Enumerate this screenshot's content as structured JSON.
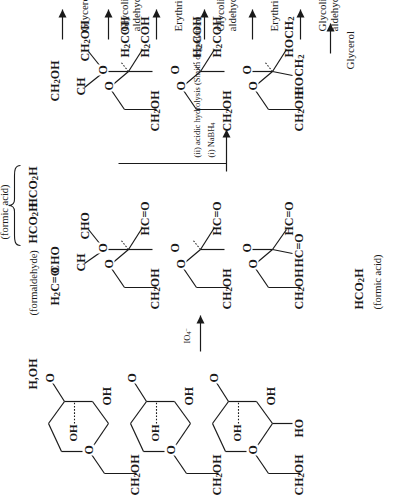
{
  "figure": {
    "orientation": "rotated-90-ccw",
    "background": "#ffffff",
    "ink": "#1a1a1a"
  },
  "reagents": {
    "step1": {
      "label": "IO",
      "sub": "4",
      "sup": "–",
      "full": "IO4–"
    },
    "step2": {
      "line1": "(i) NaBH4",
      "line1_pre": "(i) NaBH",
      "line1_sub": "4",
      "line2": "(ii) acidic hydrolysis (Smith degradation)"
    }
  },
  "column1": {
    "name": "starting polysaccharide",
    "repeat_labels": [
      "CH2OH",
      "CH2OH",
      "CH2OH",
      "CH2OH"
    ],
    "ch2oh_pre": "CH",
    "ch2oh_sub": "2",
    "ch2oh_post": "OH",
    "ring_oxygen": "O",
    "glycosidic_oxygen": "O",
    "oh_labels": [
      "OH",
      "OH",
      "OH",
      "OH"
    ],
    "inner_oh_labels": [
      "OH",
      "OH",
      "OH",
      "OH"
    ],
    "reducing_end": "H,OH",
    "non_reducing_end": "HO"
  },
  "column2": {
    "name": "polyaldehyde after periodate cleavage",
    "ch2oh_pre": "CH",
    "ch2oh_sub": "2",
    "ch2oh_post": "OH",
    "ring_oxygen": "O",
    "aldehyde": "HC=O",
    "aldehyde_alt": "CHO",
    "ch": "CH",
    "formaldehyde_formula_pre": "H",
    "formaldehyde_formula_sub": "2",
    "formaldehyde_formula_post": "C=O",
    "formaldehyde_name": "(formaldehyde)",
    "formic_acid_formula_pre": "HCO",
    "formic_acid_formula_sub": "2",
    "formic_acid_formula_post": "H",
    "formic_acid_name": "(formic acid)",
    "brace_members": [
      "HCO2H",
      "HCO2H"
    ],
    "bottom_formic_formula": "HCO2H",
    "bottom_formic_name": "(formic acid)"
  },
  "column3": {
    "name": "reduced / hydrolysed fragments",
    "ch2oh_pre": "CH",
    "ch2oh_sub": "2",
    "ch2oh_post": "OH",
    "ch": "CH",
    "ring_oxygen": "O",
    "h2coh_pre": "H",
    "h2coh_sub": "2",
    "h2coh_post": "COH",
    "hoch2_pre": "HOCH",
    "hoch2_sub": "2"
  },
  "products": [
    {
      "id": "p1",
      "label": "Glycerol"
    },
    {
      "id": "p2",
      "label": "Glycolic aldehyde",
      "line1": "Glycolic",
      "line2": "aldehyde"
    },
    {
      "id": "p3",
      "label": "Erythritol"
    },
    {
      "id": "p4",
      "label": "Glycolic aldehyde",
      "line1": "Glycolic",
      "line2": "aldehyde"
    },
    {
      "id": "p5",
      "label": "Erythritol"
    },
    {
      "id": "p6",
      "label": "Glycolic aldehyde",
      "line1": "Glycolic",
      "line2": "aldehyde"
    },
    {
      "id": "p7",
      "label": "Glycerol"
    }
  ]
}
